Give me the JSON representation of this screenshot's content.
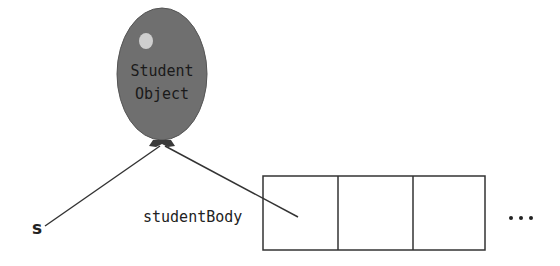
{
  "balloon": {
    "line1": "Student",
    "line2": "Object",
    "fill": "#707070",
    "highlight": "#d0d0d0"
  },
  "labels": {
    "variable_s": "s",
    "array_name": "studentBody",
    "ellipsis": "..."
  },
  "array": {
    "cells": 3
  },
  "colors": {
    "line": "#333333",
    "text": "#222222"
  }
}
